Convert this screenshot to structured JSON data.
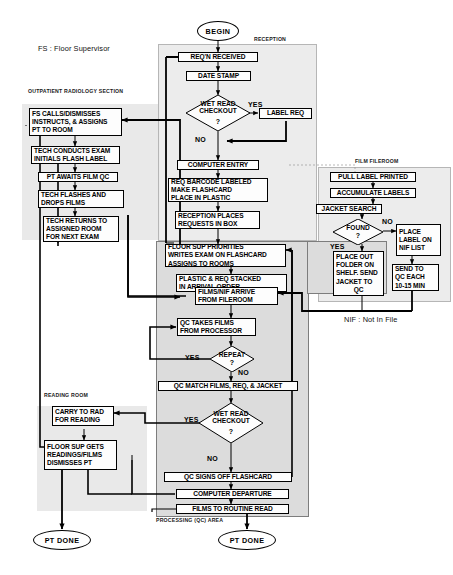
{
  "diagram": {
    "legend_fs": "FS : Floor Supervisor",
    "legend_nif": "NIF : Not In File"
  },
  "regions": [
    {
      "id": "outpatient",
      "label": "OUTPATIENT RADIOLOGY SECTION"
    },
    {
      "id": "reception",
      "label": "RECEPTION"
    },
    {
      "id": "fileroom",
      "label": "FILM FILEROOM"
    },
    {
      "id": "qc",
      "label": "PROCESSING  (QC)  AREA"
    },
    {
      "id": "reading",
      "label": "READING ROOM"
    }
  ],
  "terminators": {
    "begin": "BEGIN",
    "pt_done_left": "PT DONE",
    "pt_done_bottom": "PT DONE"
  },
  "decisions": {
    "wet_read_1": {
      "line1": "WET READ",
      "line2": "CHECKOUT",
      "q": "?",
      "yes": "YES",
      "no": "NO"
    },
    "found": {
      "line1": "FOUND",
      "line2": "",
      "q": "?",
      "yes": "YES",
      "no": "NO"
    },
    "repeat": {
      "line1": "REPEAT",
      "line2": "",
      "q": "?",
      "yes": "YES",
      "no": "NO"
    },
    "wet_read_2": {
      "line1": "WET READ",
      "line2": "CHECKOUT",
      "q": "?",
      "yes": "YES",
      "no": "NO"
    }
  },
  "nodes": {
    "fs_calls": [
      "FS CALLS/DISMISSES",
      "INSTRUCTS, & ASSIGNS",
      "PT TO ROOM"
    ],
    "tech_conducts": [
      "TECH CONDUCTS EXAM",
      "INITIALS FLASH LABEL"
    ],
    "pt_awaits": [
      "PT  AWAITS FILM QC"
    ],
    "tech_flashes": [
      "TECH FLASHES AND",
      "DROPS FILMS"
    ],
    "tech_returns": [
      "TECH RETURNS TO",
      "ASSIGNED ROOM",
      "FOR NEXT EXAM"
    ],
    "req_received": [
      "REQ'N  RECEIVED"
    ],
    "date_stamp": [
      "DATE STAMP"
    ],
    "label_req": [
      "LABEL REQ"
    ],
    "computer_entry": [
      "COMPUTER ENTRY"
    ],
    "req_barcode": [
      "REQ BARCODE  LABELED",
      "MAKE  FLASHCARD",
      "PLACE IN PLASTIC"
    ],
    "reception_places": [
      "RECEPTION PLACES",
      "REQUESTS IN BOX"
    ],
    "pull_label": [
      "PULL LABEL PRINTED"
    ],
    "accumulate": [
      "ACCUMULATE LABELS"
    ],
    "jacket_search": [
      "JACKET SEARCH"
    ],
    "place_label_nif": [
      "PLACE",
      "LABEL  ON",
      "NIF LIST"
    ],
    "place_out_folder": [
      "PLACE OUT",
      "FOLDER ON",
      "SHELF. SEND",
      "JACKET TO",
      "QC"
    ],
    "send_to_qc": [
      "SEND TO",
      "QC EACH",
      "10-15 MIN"
    ],
    "floor_sup_prior": [
      "FLOOR SUP PRIORITIES",
      "WRITES EXAM ON FLASHCARD",
      "ASSIGNS TO ROOMS"
    ],
    "plastic_req": [
      "PLASTIC  &  REQ  STACKED",
      "IN ARRIVAL  ORDER"
    ],
    "films_nif": [
      "FILMS/NIF ARRIVE",
      "FROM FILEROOM"
    ],
    "qc_takes": [
      "QC TAKES FILMS",
      "FROM PROCESSOR"
    ],
    "qc_match": [
      "QC MATCH FILMS, REQ,  & JACKET"
    ],
    "qc_signs": [
      "QC SIGNS OFF FLASHCARD"
    ],
    "computer_dep": [
      "COMPUTER DEPARTURE"
    ],
    "films_routine": [
      "FILMS TO ROUTINE READ"
    ],
    "carry_to_rad": [
      "CARRY TO RAD",
      "FOR READING"
    ],
    "floor_sup_gets": [
      "FLOOR SUP GETS",
      "READINGS/FILMS",
      "DISMISSES PT"
    ]
  },
  "colors": {
    "stroke": "#000000",
    "region_fill": "#e9e9e9",
    "hatch_fill": "#dcdcdc",
    "node_fill": "#fdfdfd"
  }
}
